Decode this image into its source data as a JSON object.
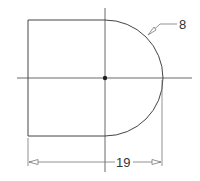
{
  "drawing": {
    "type": "technical-drawing",
    "shape": "rectangle with semicircular right end",
    "colors": {
      "line": "#444444",
      "dimension": "#777777",
      "background": "#ffffff"
    },
    "labels": {
      "radius_label": "8",
      "length_label": "19"
    },
    "geometry": {
      "rect_left": 28,
      "rect_top": 20,
      "rect_bottom": 136,
      "center_x": 105,
      "center_y": 78,
      "arc_radius": 57,
      "dimension_y": 162
    }
  }
}
